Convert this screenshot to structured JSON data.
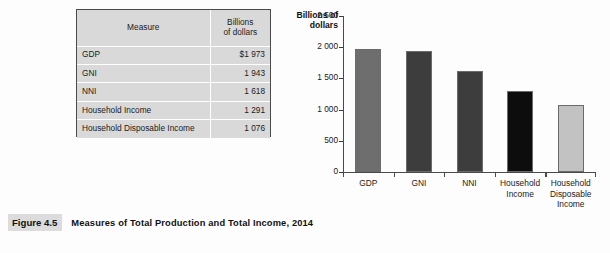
{
  "table": {
    "headers": {
      "measure": "Measure",
      "units_line1": "Billions",
      "units_line2": "of dollars"
    },
    "rows": [
      {
        "measure": "GDP",
        "value": "$1 973"
      },
      {
        "measure": "GNI",
        "value": "1 943"
      },
      {
        "measure": "NNI",
        "value": "1 618"
      },
      {
        "measure": "Household Income",
        "value": "1 291"
      },
      {
        "measure": "Household Disposable Income",
        "value": "1 076"
      }
    ]
  },
  "caption": {
    "figure_number": "Figure 4.5",
    "title": "Measures of Total Production and Total Income, 2014"
  },
  "chart_data": {
    "type": "bar",
    "title": "",
    "ylabel_line1": "Billions of",
    "ylabel_line2": "dollars",
    "xlabel": "",
    "categories": [
      "GDP",
      "GNI",
      "NNI",
      "Household Income",
      "Household Disposable Income"
    ],
    "category_label_lines": [
      [
        "GDP"
      ],
      [
        "GNI"
      ],
      [
        "NNI"
      ],
      [
        "Household",
        "Income"
      ],
      [
        "Household",
        "Disposable",
        "Income"
      ]
    ],
    "values": [
      1973,
      1943,
      1618,
      1291,
      1076
    ],
    "ylim": [
      0,
      2500
    ],
    "yticks": [
      0,
      500,
      1000,
      1500,
      2000,
      2500
    ],
    "ytick_labels": [
      "0",
      "500",
      "1 000",
      "1 500",
      "2 000",
      "2 500"
    ],
    "grid": false,
    "legend": "none",
    "bar_colors": [
      "#6e6e6e",
      "#3d3d3d",
      "#3d3d3d",
      "#0d0d0d",
      "#c2c2c2"
    ],
    "units": "Billions of dollars"
  }
}
